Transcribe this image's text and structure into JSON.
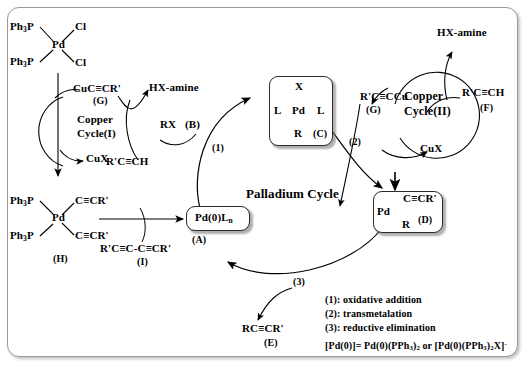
{
  "diagram": {
    "title_main": "Palladium Cycle",
    "title_copper_1_line1": "Copper",
    "title_copper_1_line2": "Cycle(I)",
    "title_copper_2_line1": "Copper",
    "title_copper_2_line2": "Cycle(II)"
  },
  "precatalyst": {
    "ligand_top": "Ph₃P",
    "ligand_bottom": "Ph₃P",
    "metal": "Pd",
    "halide_top": "Cl",
    "halide_bottom": "Cl"
  },
  "copper_cycle_1": {
    "species_top": "CuC≡CR'",
    "species_top_tag": "(G)",
    "species_bottom": "CuX"
  },
  "copper_cycle_2": {
    "species_left": "R'C≡CCu",
    "species_left_tag": "(G)",
    "species_bottom": "CuX",
    "amine_out": "HX-amine",
    "alkyne_in": "R'C≡CH",
    "alkyne_in_tag": "(F)"
  },
  "crossing_left": {
    "amine_out": "HX-amine",
    "alkyne_in": "R'C≡CH"
  },
  "reagents": {
    "organohalide": "RX",
    "organohalide_tag": "(B)"
  },
  "species_A": {
    "formula": "Pd(0)L",
    "formula_sub": "n",
    "tag": "(A)"
  },
  "species_C": {
    "top": "X",
    "left": "L",
    "metal": "Pd",
    "right": "L",
    "bottom": "R",
    "tag": "(C)"
  },
  "species_D": {
    "metal": "Pd",
    "alkynyl": "C≡CR'",
    "r_group": "R",
    "tag": "(D)"
  },
  "species_E": {
    "formula": "RC≡CR'",
    "tag": "(E)"
  },
  "species_H": {
    "ligand_top": "Ph₃P",
    "ligand_bottom": "Ph₃P",
    "metal": "Pd",
    "alkynyl_top": "C≡CR'",
    "alkynyl_bottom": "C≡CR'",
    "tag": "(H)"
  },
  "species_I": {
    "formula": "R'C≡C-C≡CR'",
    "tag": "(I)"
  },
  "step_labels": {
    "step1": "(1)",
    "step2": "(2)",
    "step3": "(3)"
  },
  "legend": {
    "line1": "(1): oxidative addition",
    "line2": "(2): transmetalation",
    "line3": "(3): reductive elimination",
    "line4_pre": "[Pd(0)]= Pd(0)(PPh",
    "line4_sub1": "3",
    "line4_mid": ")",
    "line4_sub2": "2",
    "line4_or": " or [Pd(0)(PPh",
    "line4_sub3": "3",
    "line4_mid2": ")",
    "line4_sub4": "2",
    "line4_end": "X]",
    "line4_sup": "-",
    "full": "[Pd(0)]= Pd(0)(PPh3)2 or [Pd(0)(PPh3)2X]-"
  },
  "colors": {
    "ink": "#000000",
    "frame_border": "#9a9a9a",
    "box_border": "#2b2b2b",
    "background": "#ffffff"
  }
}
